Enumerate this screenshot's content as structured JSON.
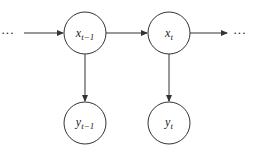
{
  "diagram": {
    "type": "hidden-markov-model",
    "left_ellipsis": "···",
    "right_ellipsis": "···",
    "nodes": [
      {
        "id": "x_prev",
        "base": "x",
        "sub": "t−1",
        "cx": 85,
        "cy": 33,
        "r": 21
      },
      {
        "id": "x_curr",
        "base": "x",
        "sub": "t",
        "cx": 169,
        "cy": 33,
        "r": 21
      },
      {
        "id": "y_prev",
        "base": "y",
        "sub": "t−1",
        "cx": 85,
        "cy": 123,
        "r": 21
      },
      {
        "id": "y_curr",
        "base": "y",
        "sub": "t",
        "cx": 169,
        "cy": 123,
        "r": 21
      }
    ],
    "edges": [
      {
        "from": "left_ellipsis",
        "to": "x_prev"
      },
      {
        "from": "x_prev",
        "to": "x_curr"
      },
      {
        "from": "x_curr",
        "to": "right_ellipsis"
      },
      {
        "from": "x_prev",
        "to": "y_prev"
      },
      {
        "from": "x_curr",
        "to": "y_curr"
      }
    ],
    "stroke_color": "#333333"
  }
}
